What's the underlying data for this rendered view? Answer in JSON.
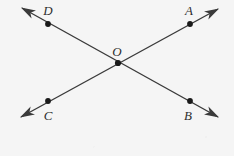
{
  "figure": {
    "type": "geometry-diagram",
    "background_color": "#f5f5f5",
    "stroke_color": "#3a3a3a",
    "point_color": "#1a1a1a",
    "label_color": "#2e2e2e",
    "width": 234,
    "height": 156
  },
  "points": [
    {
      "id": "D",
      "label": "D",
      "x": 48,
      "y": 24,
      "label_x": 48,
      "label_y": 10
    },
    {
      "id": "A",
      "label": "A",
      "x": 190,
      "y": 24,
      "label_x": 189,
      "label_y": 10
    },
    {
      "id": "O",
      "label": "O",
      "x": 118,
      "y": 63,
      "label_x": 117,
      "label_y": 51
    },
    {
      "id": "C",
      "label": "C",
      "x": 48,
      "y": 101,
      "label_x": 48,
      "label_y": 115
    },
    {
      "id": "B",
      "label": "B",
      "x": 190,
      "y": 101,
      "label_x": 188,
      "label_y": 115
    }
  ],
  "lines": [
    {
      "id": "line-CA",
      "through": [
        "C",
        "O",
        "A"
      ],
      "start_x": 21,
      "start_y": 117,
      "end_x": 218,
      "end_y": 9,
      "arrow_start": true,
      "arrow_end": true
    },
    {
      "id": "line-DB",
      "through": [
        "D",
        "O",
        "B"
      ],
      "start_x": 22,
      "start_y": 8,
      "end_x": 218,
      "end_y": 117,
      "arrow_start": true,
      "arrow_end": true
    }
  ]
}
